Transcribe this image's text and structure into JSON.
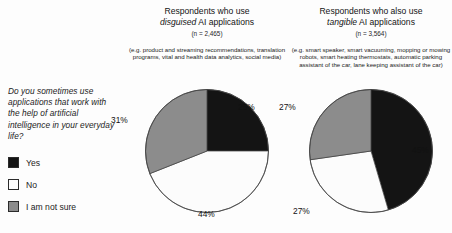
{
  "question": {
    "text": "Do you sometimes use applications that work with the help of artificial intelligence in your everyday life?"
  },
  "legend": {
    "items": [
      {
        "label": "Yes",
        "color": "#141414",
        "swatch": "yes"
      },
      {
        "label": "No",
        "color": "#fcfcfc",
        "swatch": "no"
      },
      {
        "label": "I am not sure",
        "color": "#8c8c8c",
        "swatch": "unsure"
      }
    ]
  },
  "panels": [
    {
      "title_line1": "Respondents who use",
      "title_em": "disguised",
      "title_rest": " AI applications",
      "n": "(n = 2,465)",
      "examples": "(e.g. product and streaming recommendations, translation programs, vital and health data analytics, social media)",
      "labels": {
        "yes": "25%",
        "no": "44%",
        "unsure": "31%"
      }
    },
    {
      "title_line1": "Respondents who also use",
      "title_em": "tangible",
      "title_rest": " AI applications",
      "n": "(n = 3,564)",
      "examples": "(e.g. smart speaker, smart vacuuming, mopping or mowing robots, smart heating thermostats, automatic parking assistant of the car, lane keeping assistant of the car)",
      "labels": {
        "yes": "45%",
        "no": "27%",
        "unsure": "27%"
      }
    }
  ],
  "chart_data": [
    {
      "type": "pie",
      "title": "Respondents who use disguised AI applications",
      "subtitle": "(n = 2,465)",
      "note": "(e.g. product and streaming recommendations, translation programs, vital and health data analytics, social media)",
      "categories": [
        "Yes",
        "No",
        "I am not sure"
      ],
      "values": [
        25,
        44,
        31
      ],
      "unit": "%",
      "colors": [
        "#141414",
        "#fcfcfc",
        "#8c8c8c"
      ],
      "start_angle_deg": 0,
      "direction": "clockwise",
      "legend_position": "left",
      "n": 2465
    },
    {
      "type": "pie",
      "title": "Respondents who also use tangible AI applications",
      "subtitle": "(n = 3,564)",
      "note": "(e.g. smart speaker, smart vacuuming, mopping or mowing robots, smart heating thermostats, automatic parking assistant of the car, lane keeping assistant of the car)",
      "categories": [
        "Yes",
        "No",
        "I am not sure"
      ],
      "values": [
        45,
        27,
        27
      ],
      "unit": "%",
      "colors": [
        "#141414",
        "#fcfcfc",
        "#8c8c8c"
      ],
      "start_angle_deg": 0,
      "direction": "clockwise",
      "legend_position": "left",
      "n": 3564
    }
  ]
}
